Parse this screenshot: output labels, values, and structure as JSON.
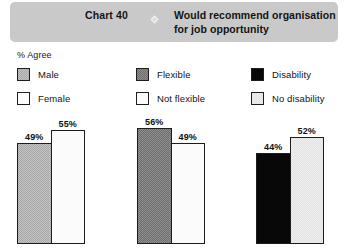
{
  "header": {
    "chart_number": "Chart 40",
    "icon": "diamond-icon",
    "title": "Would recommend organisation for job opportunity",
    "background_color": "#c9c9c9"
  },
  "axis_caption": "% Agree",
  "legend": {
    "groups": [
      {
        "items": [
          {
            "label": "Male",
            "swatch": "mid-gray",
            "color": "#a8a8a8"
          },
          {
            "label": "Female",
            "swatch": "white",
            "color": "#fbfbfb"
          }
        ]
      },
      {
        "items": [
          {
            "label": "Flexible",
            "swatch": "dark-gray",
            "color": "#6e6e6e"
          },
          {
            "label": "Not flexible",
            "swatch": "white",
            "color": "#ffffff"
          }
        ]
      },
      {
        "items": [
          {
            "label": "Disability",
            "swatch": "black",
            "color": "#080808"
          },
          {
            "label": "No disability",
            "swatch": "light-gray",
            "color": "#e2e2e2"
          }
        ]
      }
    ]
  },
  "chart_data": {
    "type": "bar",
    "title": "Would recommend organisation for job opportunity",
    "xlabel": "",
    "ylabel": "% Agree",
    "ylim": [
      0,
      60
    ],
    "grid": false,
    "legend_position": "top",
    "groups": [
      {
        "name": "Gender",
        "categories": [
          "Male",
          "Female"
        ],
        "values": [
          49,
          55
        ],
        "labels": [
          "49%",
          "55%"
        ],
        "colors": [
          "#a8a8a8",
          "#fbfbfb"
        ]
      },
      {
        "name": "Flexibility",
        "categories": [
          "Flexible",
          "Not flexible"
        ],
        "values": [
          56,
          49
        ],
        "labels": [
          "56%",
          "49%"
        ],
        "colors": [
          "#6e6e6e",
          "#ffffff"
        ]
      },
      {
        "name": "Disability",
        "categories": [
          "Disability",
          "No disability"
        ],
        "values": [
          44,
          52
        ],
        "labels": [
          "44%",
          "52%"
        ],
        "colors": [
          "#080808",
          "#e2e2e2"
        ]
      }
    ]
  }
}
